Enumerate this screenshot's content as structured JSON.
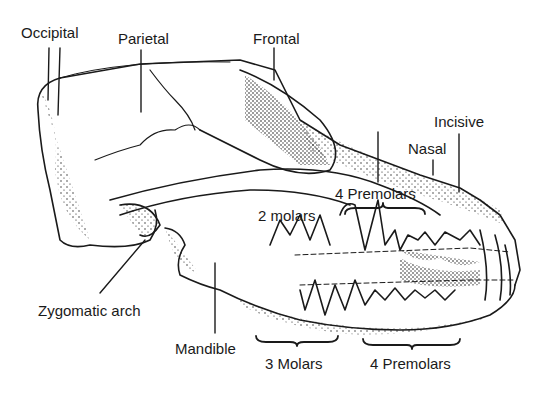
{
  "diagram": {
    "labels": {
      "occipital": "Occipital",
      "parietal": "Parietal",
      "frontal": "Frontal",
      "incisive": "Incisive",
      "nasal": "Nasal",
      "upper_premolars": "4 Premolars",
      "upper_molars": "2 molars",
      "zygomatic_arch": "Zygomatic arch",
      "mandible": "Mandible",
      "lower_molars": "3 Molars",
      "lower_premolars": "4 Premolars"
    },
    "colors": {
      "ink": "#1a1a1a",
      "background": "#ffffff"
    }
  }
}
